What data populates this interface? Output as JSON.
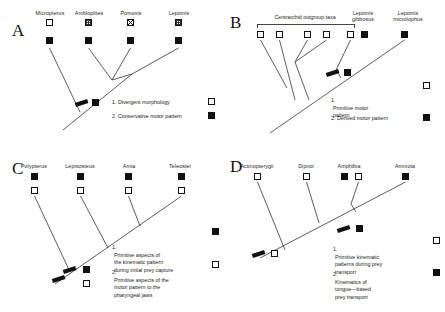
{
  "figure": {
    "type": "phylogenetic-character-mapping",
    "panels": [
      "A",
      "B",
      "C",
      "D"
    ]
  },
  "panels": {
    "A": {
      "letter": "A",
      "taxa": [
        {
          "name": "Micropterus",
          "top_marker": "open",
          "bottom_marker": "filled"
        },
        {
          "name": "Ambloplites",
          "top_marker": "stipple",
          "bottom_marker": "filled"
        },
        {
          "name": "Pomoxis",
          "top_marker": "crossed",
          "bottom_marker": "filled"
        },
        {
          "name": "Lepomis",
          "top_marker": "stipple",
          "bottom_marker": "filled"
        }
      ],
      "node_markers": [
        {
          "type": "bar"
        },
        {
          "type": "filled"
        }
      ],
      "legend": [
        {
          "num": "1.",
          "text": "Divergent morphology",
          "marker": "open"
        },
        {
          "num": "2.",
          "text": "Conservative motor pattern",
          "marker": "filled"
        }
      ]
    },
    "B": {
      "letter": "B",
      "bracket_label": "Centrarchid outgroup taxa",
      "outgroup_markers": [
        "open",
        "open",
        "open",
        "open"
      ],
      "taxa": [
        {
          "name": "Lepomis\ngibbosus",
          "markers": [
            "open",
            "filled"
          ]
        },
        {
          "name": "Lepomis\nmicrolophus",
          "markers": [
            "filled"
          ]
        }
      ],
      "node_markers": [
        {
          "type": "bar"
        },
        {
          "type": "filled"
        }
      ],
      "legend": [
        {
          "num": "1.",
          "text": "Primitive motor\n    pattern",
          "marker": "open"
        },
        {
          "num": "2.",
          "text": "Derived motor pattern",
          "marker": "filled"
        }
      ]
    },
    "C": {
      "letter": "C",
      "taxa": [
        {
          "name": "Polypterus",
          "top_marker": "filled",
          "bottom_marker": "open"
        },
        {
          "name": "Lepisosteus",
          "top_marker": "filled",
          "bottom_marker": "open"
        },
        {
          "name": "Amia",
          "top_marker": "filled",
          "bottom_marker": "open"
        },
        {
          "name": "Teleostei",
          "top_marker": "filled",
          "bottom_marker": "open"
        }
      ],
      "node_markers": [
        {
          "type": "bar"
        },
        {
          "type": "bar"
        },
        {
          "type": "filled"
        },
        {
          "type": "open"
        }
      ],
      "legend": [
        {
          "num": "1.",
          "text": "Primitive aspects of\n    the kinematic pattern\n    during initial prey capture",
          "marker": "filled"
        },
        {
          "num": "2.",
          "text": "Primitive aspects of the\n    motor pattern to the\n    pharyngeal jaws",
          "marker": "open"
        }
      ]
    },
    "D": {
      "letter": "D",
      "taxa": [
        {
          "name": "Actinopterygii",
          "markers": [
            "open"
          ]
        },
        {
          "name": "Dipnoi",
          "markers": [
            "open"
          ]
        },
        {
          "name": "Amphibia",
          "markers": [
            "filled",
            "open"
          ]
        },
        {
          "name": "Amniota",
          "markers": [
            "filled"
          ]
        }
      ],
      "node_markers": [
        {
          "type": "bar"
        },
        {
          "type": "filled"
        },
        {
          "type": "bar"
        },
        {
          "type": "open"
        }
      ],
      "legend": [
        {
          "num": "1.",
          "text": "Primitive kinematic\n    patterns during prey\n    transport",
          "marker": "open"
        },
        {
          "num": "2.",
          "text": "Kinematics of\n    tongue—based\n    prey transport",
          "marker": "filled"
        }
      ]
    }
  },
  "colors": {
    "ink": "#111111",
    "line": "#333333",
    "background": "#ffffff"
  }
}
